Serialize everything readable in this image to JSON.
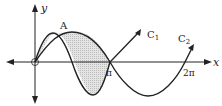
{
  "diagram": {
    "type": "function-graph",
    "axes": {
      "x_label": "x",
      "y_label": "y",
      "origin_label": "O",
      "x_ticks": [
        "π",
        "2π"
      ]
    },
    "curves": [
      {
        "name": "C1",
        "label": "C",
        "subscript": "1",
        "function": "y = sin 2x"
      },
      {
        "name": "C2",
        "label": "C",
        "subscript": "2",
        "function": "y = sin x"
      }
    ],
    "points": [
      {
        "label": "A",
        "description": "intersection of C1 and C2"
      }
    ],
    "shaded_region": "between C1 and C2 from 0 to π",
    "colors": {
      "stroke": "#222222",
      "fill": "#d9d9d9"
    }
  }
}
